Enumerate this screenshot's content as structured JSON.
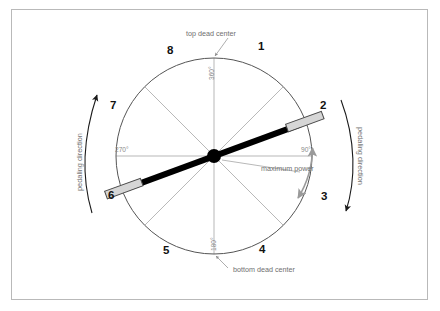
{
  "figure": {
    "background_color": "#ffffff",
    "border_color": "#b9b9b9"
  },
  "wheel": {
    "center": {
      "x": 214,
      "y": 156
    },
    "radius": 98,
    "sector_count": 8,
    "circle_color": "#555555",
    "spoke_color": "#9a9a9a",
    "hub_color": "#000000"
  },
  "positions": [
    {
      "id": "1",
      "label": "1",
      "x": 258,
      "y": 47
    },
    {
      "id": "2",
      "label": "2",
      "x": 320,
      "y": 106
    },
    {
      "id": "3",
      "label": "3",
      "x": 321,
      "y": 197
    },
    {
      "id": "4",
      "label": "4",
      "x": 259,
      "y": 250
    },
    {
      "id": "5",
      "label": "5",
      "x": 163,
      "y": 251
    },
    {
      "id": "6",
      "label": "6",
      "x": 108,
      "y": 196
    },
    {
      "id": "7",
      "label": "7",
      "x": 110,
      "y": 106
    },
    {
      "id": "8",
      "label": "8",
      "x": 167,
      "y": 51
    }
  ],
  "annotations": {
    "top_dead_center": {
      "label": "top dead center",
      "x": 186,
      "y": 33
    },
    "bottom_dead_center": {
      "label": "bottom dead center",
      "x": 217,
      "y": 270
    },
    "maximum_power": {
      "label": "maximum power",
      "x": 261,
      "y": 168
    },
    "pedaling_direction_left": {
      "label": "pedaling direction",
      "x": 74,
      "y": 183
    },
    "pedaling_direction_right": {
      "label": "pedaling direction",
      "x": 362,
      "y": 130
    }
  },
  "angles": {
    "top": {
      "label": "360°",
      "x": 207,
      "y": 63
    },
    "right": {
      "label": "90°",
      "x": 303,
      "y": 150
    },
    "bottom": {
      "label": "180°",
      "x": 210,
      "y": 235
    },
    "left": {
      "label": "270°",
      "x": 116,
      "y": 150
    }
  },
  "crank": {
    "angle_degrees": 20,
    "arm_color": "#000000",
    "arm_length": 92,
    "pedal_fill": "#d6d6d6",
    "pedal_stroke": "#4a4a4a",
    "pedals": [
      {
        "id": "pedal-upper-right",
        "position_ref": "2"
      },
      {
        "id": "pedal-lower-left",
        "position_ref": "6"
      }
    ]
  },
  "power_arc": {
    "color": "#9a9a9a",
    "from_angle_label": "90°",
    "to_position_label": "3",
    "double_headed": true
  }
}
